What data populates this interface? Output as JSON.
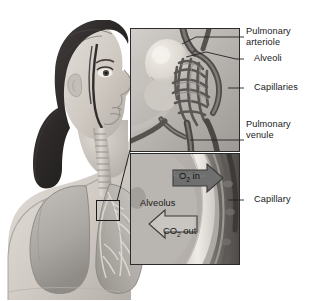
{
  "figure": {
    "style": "grayscale medical illustration"
  },
  "subject": {
    "name": "woman-profile-with-lungs",
    "parts": [
      "head-profile",
      "hair",
      "trachea",
      "left-lung",
      "right-lung",
      "bronchial-tree"
    ]
  },
  "locator": {
    "name": "lung-detail-box",
    "x": 96,
    "y": 200,
    "width": 22,
    "height": 19
  },
  "panels": [
    {
      "id": "alveolar-sac",
      "x": 130,
      "y": 28,
      "width": 108,
      "height": 122,
      "contents": [
        "alveolar-sac",
        "capillary-network",
        "arteriole",
        "venule"
      ]
    },
    {
      "id": "gas-exchange",
      "x": 130,
      "y": 153,
      "width": 108,
      "height": 110,
      "contents": [
        "alveolus-wall",
        "capillary-lumen",
        "o2-arrow",
        "co2-arrow"
      ]
    }
  ],
  "labels": [
    {
      "id": "pulmonary-arteriole",
      "text": "Pulmonary\narteriole",
      "x": 246,
      "y": 26
    },
    {
      "id": "alveoli",
      "text": "Alveoli",
      "x": 254,
      "y": 55
    },
    {
      "id": "capillaries",
      "text": "Capillaries",
      "x": 254,
      "y": 83
    },
    {
      "id": "pulmonary-venule",
      "text": "Pulmonary\nvenule",
      "x": 246,
      "y": 119
    },
    {
      "id": "capillary",
      "text": "Capillary",
      "x": 254,
      "y": 195
    }
  ],
  "inset_labels": [
    {
      "id": "alveolus",
      "text": "Alveolus",
      "x": 140,
      "y": 198
    }
  ],
  "arrows": [
    {
      "id": "o2-in",
      "label": "O",
      "sub": "2",
      "suffix": " in",
      "direction": "right",
      "fill": "#6f6f6f",
      "x": 172,
      "y": 168,
      "width": 60,
      "height": 22
    },
    {
      "id": "co2-out",
      "label": "CO",
      "sub": "2",
      "suffix": " out",
      "direction": "left",
      "fill": "#c9c9c9",
      "x": 158,
      "y": 222,
      "width": 66,
      "height": 23
    }
  ],
  "colors": {
    "background": "#ffffff",
    "skin": "#cfcac4",
    "hair": "#2e2b2a",
    "lung": "#b3b0ac",
    "vessel_dark": "#5c5c5c",
    "panel_bg": "#b9b9b9",
    "text": "#1a1a1a",
    "line": "#222222"
  }
}
